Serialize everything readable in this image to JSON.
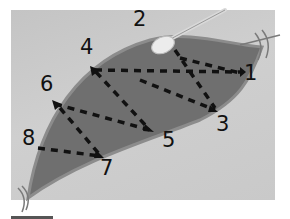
{
  "figure": {
    "labels": [
      {
        "id": "1",
        "text": "1",
        "x": 244,
        "y": 63
      },
      {
        "id": "2",
        "text": "2",
        "x": 133,
        "y": 9
      },
      {
        "id": "3",
        "text": "3",
        "x": 216,
        "y": 114
      },
      {
        "id": "4",
        "text": "4",
        "x": 80,
        "y": 37
      },
      {
        "id": "5",
        "text": "5",
        "x": 162,
        "y": 130
      },
      {
        "id": "6",
        "text": "6",
        "x": 40,
        "y": 74
      },
      {
        "id": "7",
        "text": "7",
        "x": 100,
        "y": 158
      },
      {
        "id": "8",
        "text": "8",
        "x": 22,
        "y": 128
      }
    ],
    "colors": {
      "background_panel": "#c9c9c9",
      "tissue": "#6e6e6e",
      "tissue_edge": "#8a8a8a",
      "dash": "#111111",
      "swab": "#e8e8e8"
    },
    "objects": {
      "swab": "cotton-swab-applicator",
      "sutures": "tie-sutures-at-ends"
    }
  }
}
